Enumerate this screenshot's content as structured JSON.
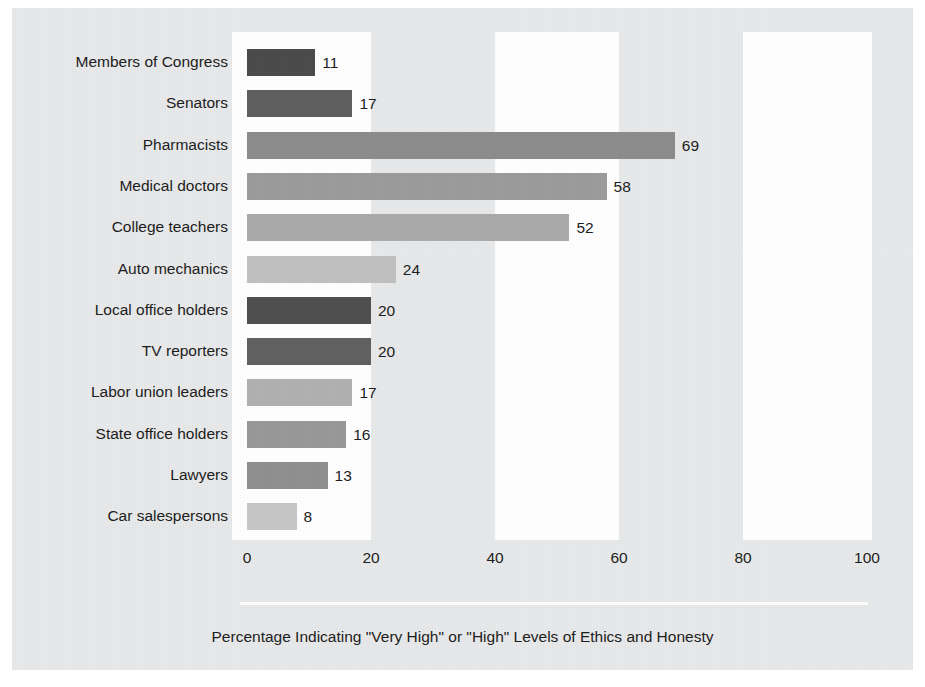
{
  "chart_data": {
    "type": "bar",
    "orientation": "horizontal",
    "title": "",
    "subtitle": "",
    "xlabel": "Percentage Indicating \"Very High\" or \"High\" Levels of Ethics and Honesty",
    "ylabel": "",
    "xlim": [
      0,
      100
    ],
    "xticks": [
      0,
      20,
      40,
      60,
      80,
      100
    ],
    "xtick_labels": [
      "0",
      "20",
      "40",
      "60",
      "80",
      "100"
    ],
    "grid": false,
    "banding": "alternating vertical bands every 20 units",
    "legend": null,
    "value_labels_shown": true,
    "categories": [
      "Members of Congress",
      "Senators",
      "Pharmacists",
      "Medical doctors",
      "College teachers",
      "Auto mechanics",
      "Local office holders",
      "TV reporters",
      "Labor union leaders",
      "State office holders",
      "Lawyers",
      "Car salespersons"
    ],
    "values": [
      11,
      17,
      69,
      58,
      52,
      24,
      20,
      20,
      17,
      16,
      13,
      8
    ],
    "value_label_texts": [
      "11",
      "17",
      "69",
      "58",
      "52",
      "24",
      "20",
      "20",
      "17",
      "16",
      "13",
      "8"
    ],
    "bar_colors": [
      "#4a4a4a",
      "#5e5e5e",
      "#8c8c8c",
      "#9b9b9b",
      "#a9a9a9",
      "#c0c0c0",
      "#4e4e4e",
      "#606060",
      "#b0b0b0",
      "#989898",
      "#8f8f8f",
      "#c6c6c6"
    ]
  },
  "caption": {
    "text": "Percentage Indicating \"Very High\" or \"High\" Levels of Ethics and Honesty"
  },
  "colors": {
    "panel_background": "#e8e9ea",
    "plot_background": "#ffffff",
    "band_fill": "#e8e9ea",
    "text": "#1b1b1b",
    "rule": "#fdfdfd"
  }
}
